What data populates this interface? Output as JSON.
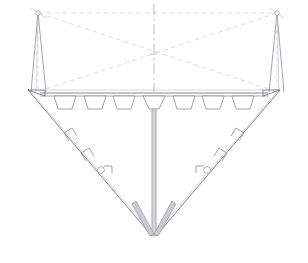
{
  "drawing": {
    "title": "Hull Body Plan Section",
    "type": "cad-line-drawing",
    "view_name": "midship-transverse-section",
    "canvas": {
      "width": 308,
      "height": 263,
      "background": "#ffffff"
    }
  },
  "style": {
    "line_color": "#7b7f87",
    "faint_line_color": "#b9bcc2",
    "dash_color": "#c2c5cb",
    "centerline_color": "#9aa0a8",
    "fill_gray": "#c9cbcf",
    "fill_light_gray": "#d4d6da",
    "fill_white": "#ffffff"
  },
  "geometry": {
    "centerline": {
      "x": 154,
      "y_top": 4,
      "y_bottom": 247
    },
    "deck": {
      "y": 93,
      "left_x": 40,
      "right_x": 268,
      "thickness": 3
    },
    "sheer_left": {
      "x": 28,
      "y": 90
    },
    "sheer_right": {
      "x": 280,
      "y": 90
    },
    "keel_point": {
      "x": 154,
      "y": 236
    },
    "hull_left_line": {
      "x1": 28,
      "y1": 90,
      "x2": 152,
      "y2": 236
    },
    "hull_right_line": {
      "x1": 280,
      "y1": 90,
      "x2": 156,
      "y2": 236
    }
  },
  "masts": [
    {
      "id": "mast-port",
      "head": {
        "x": 38,
        "y": 13
      },
      "foot_inner": {
        "x": 46,
        "y": 92
      },
      "foot_outer": {
        "x": 31,
        "y": 92
      },
      "node_radius": 2.2,
      "has_drop_line": true
    },
    {
      "id": "mast-starboard",
      "head": {
        "x": 277,
        "y": 13
      },
      "foot_inner": {
        "x": 269,
        "y": 92
      },
      "foot_outer": {
        "x": 284,
        "y": 92
      },
      "node_radius": 2.2,
      "has_drop_line": true
    }
  ],
  "rigging": {
    "description": "crossed construction / stay lines",
    "lines": [
      {
        "name": "stay-port-to-starboard-deck",
        "x1": 38,
        "y1": 13,
        "x2": 278,
        "y2": 92
      },
      {
        "name": "stay-starboard-to-port-deck",
        "x1": 277,
        "y1": 13,
        "x2": 37,
        "y2": 92
      },
      {
        "name": "head-to-head-upper",
        "x1": 38,
        "y1": 13,
        "x2": 277,
        "y2": 13
      }
    ]
  },
  "deck_frames": {
    "count": 7,
    "label": "trapezoidal deck girders",
    "items": [
      {
        "index": 1,
        "cx": 65,
        "top_half": 11,
        "bottom_half": 7,
        "depth": 13,
        "is_center": false
      },
      {
        "index": 2,
        "cx": 95,
        "top_half": 11,
        "bottom_half": 7,
        "depth": 13,
        "is_center": false
      },
      {
        "index": 3,
        "cx": 124,
        "top_half": 11,
        "bottom_half": 7,
        "depth": 13,
        "is_center": false
      },
      {
        "index": 4,
        "cx": 154,
        "top_half": 11,
        "bottom_half": 5,
        "depth": 13,
        "is_center": true
      },
      {
        "index": 5,
        "cx": 184,
        "top_half": 11,
        "bottom_half": 7,
        "depth": 13,
        "is_center": false
      },
      {
        "index": 6,
        "cx": 213,
        "top_half": 11,
        "bottom_half": 7,
        "depth": 13,
        "is_center": false
      },
      {
        "index": 7,
        "cx": 243,
        "top_half": 11,
        "bottom_half": 7,
        "depth": 13,
        "is_center": false
      }
    ]
  },
  "hull_brackets": {
    "label": "side stiffener brackets",
    "port": [
      {
        "index": 1,
        "x": 68,
        "y": 137,
        "type": "angle"
      },
      {
        "index": 2,
        "x": 85,
        "y": 157,
        "type": "angle"
      }
    ],
    "starboard": [
      {
        "index": 1,
        "x": 240,
        "y": 137,
        "type": "angle"
      },
      {
        "index": 2,
        "x": 223,
        "y": 157,
        "type": "angle"
      }
    ]
  },
  "round_fittings": {
    "label": "pipe / duct penetration",
    "radius": 3.4,
    "port": {
      "x": 101,
      "y": 170
    },
    "starboard": {
      "x": 207,
      "y": 170
    }
  },
  "keel_detail": {
    "label": "keel and bilge strake thickening",
    "vertical_bar": {
      "x": 154,
      "y_top": 98,
      "y_bottom": 236,
      "width": 4
    },
    "port_strake": {
      "x1": 134,
      "y1": 206,
      "x2": 152,
      "y2": 234,
      "width": 4
    },
    "starboard_strake": {
      "x1": 174,
      "y1": 206,
      "x2": 156,
      "y2": 234,
      "width": 4
    }
  },
  "centerline_marks": {
    "upper": {
      "x": 154,
      "y_top": 4,
      "y_bottom": 92
    },
    "lower": {
      "x": 154,
      "y_top": 98,
      "y_bottom": 230
    },
    "cross_tick": {
      "x": 154,
      "y": 54,
      "half_len": 4
    }
  }
}
